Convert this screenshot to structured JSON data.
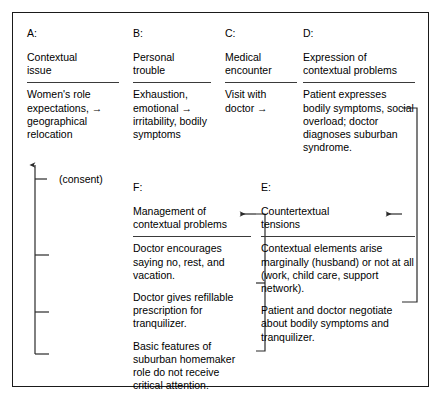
{
  "figure": {
    "columns": [
      {
        "key": "A:",
        "title": "Contextual\nissue",
        "title_line1": "Contextual",
        "title_line2": "issue",
        "body": [
          "Women's role expectations, → geographical relocation"
        ]
      },
      {
        "key": "B:",
        "title_line1": "Personal",
        "title_line2": "trouble",
        "body": [
          "Exhaustion, emotional → irritability, bodily symptoms"
        ]
      },
      {
        "key": "C:",
        "title_line1": "Medical",
        "title_line2": "encounter",
        "body": [
          "Visit with doctor →"
        ]
      },
      {
        "key": "D:",
        "title_line1": "Expression of",
        "title_line2": "contextual problems",
        "body": [
          "Patient expresses bodily symptoms, social overload; doctor diagnoses suburban syndrome."
        ]
      },
      {
        "key": "F:",
        "title_line1": "Management of",
        "title_line2": "contextual problems",
        "body": [
          "Doctor encourages saying no, rest, and vacation.",
          "Doctor gives refillable prescription for tranquilizer.",
          "Basic features of suburban homemaker role do not receive critical attention."
        ]
      },
      {
        "key": "E:",
        "title_line1": "Countertextual",
        "title_line2": "tensions",
        "body": [
          "Contextual elements arise marginally (husband) or not at all (work, child care, support network).",
          "Patient and doctor negotiate about bodily symptoms and tranquilizer."
        ]
      }
    ],
    "consent_label": "(consent)",
    "colors": {
      "border": "#1a1a1a",
      "rule": "#3a3a3a",
      "connector": "#2a2a2a",
      "background": "#ffffff"
    }
  }
}
